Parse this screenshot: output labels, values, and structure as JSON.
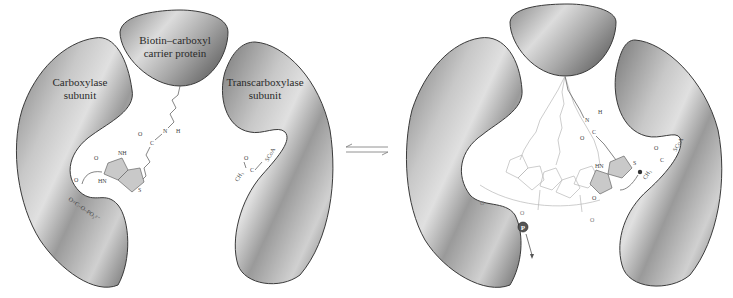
{
  "diagram": {
    "type": "enzyme-mechanism-schematic",
    "left_state": {
      "subunits": [
        {
          "id": "carboxylase",
          "label_line1": "Carboxylase",
          "label_line2": "subunit"
        },
        {
          "id": "bccp",
          "label_line1": "Biotin–carboxyl",
          "label_line2": "carrier protein"
        },
        {
          "id": "transcarboxylase",
          "label_line1": "Transcarboxylase",
          "label_line2": "subunit"
        }
      ],
      "chem_labels": {
        "biotin_nh": "NH",
        "biotin_hn": "HN",
        "biotin_o": "O",
        "biotin_s": "S",
        "amide_o": "O",
        "amide_c": "C",
        "amide_n": "N",
        "amide_h": "H",
        "carboxyphosphate": "O=C–O–PO₃²⁻",
        "carboxyphosphate_o": "O",
        "acyl_coa_ch3": "CH₃",
        "acyl_coa_c": "C",
        "acyl_coa_o": "O",
        "acyl_coa_scoa": "SCoA"
      }
    },
    "equilibrium_arrow": "⇌",
    "right_state": {
      "subunits": [
        {
          "id": "carboxylase",
          "label_line1": "",
          "label_line2": ""
        },
        {
          "id": "bccp",
          "label_line1": "",
          "label_line2": ""
        },
        {
          "id": "transcarboxylase",
          "label_line1": "",
          "label_line2": ""
        }
      ],
      "chem_labels": {
        "phosphate": "P",
        "biotin_hn": "HN",
        "biotin_o": "O",
        "biotin_s": "S",
        "acyl_coa_ch2": "CH₂",
        "acyl_coa_c": "C",
        "acyl_coa_o": "O",
        "acyl_coa_scoa": "SCoA",
        "amide_n": "N",
        "amide_h": "H",
        "amide_o": "O",
        "amide_c": "C",
        "carboxyl_o": "O"
      }
    },
    "colors": {
      "subunit_dark": "#6e6e6e",
      "subunit_light": "#d6d6d6",
      "outline": "#3a3a3a",
      "biotin_ring_fill": "#c9c9c9",
      "ghost_chain": "#b8b8b8",
      "background": "#ffffff"
    }
  }
}
